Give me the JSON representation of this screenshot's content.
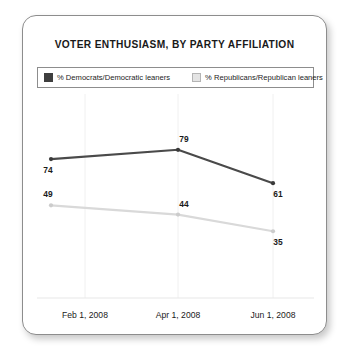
{
  "card": {
    "title": "VOTER ENTHUSIASM, BY PARTY AFFILIATION",
    "border_color": "#8d8d8d",
    "background": "#ffffff"
  },
  "legend": {
    "entries": [
      {
        "label": "% Democrats/Democratic leaners",
        "color": "#3f3f3f",
        "swatch": "dem"
      },
      {
        "label": "% Republicans/Republican leaners",
        "color": "#e4e4e4",
        "swatch": "rep"
      }
    ]
  },
  "chart_data": {
    "type": "line",
    "title": "VOTER ENTHUSIASM, BY PARTY AFFILIATION",
    "xlabel": "",
    "ylabel": "",
    "categories": [
      "Feb 1, 2008",
      "Apr 1, 2008",
      "Jun 1, 2008"
    ],
    "x_tick_labels": [
      "Feb 1, 2008",
      "Apr 1, 2008",
      "Jun 1, 2008"
    ],
    "ylim": [
      0,
      100
    ],
    "grid": "vertical-only",
    "legend_position": "top",
    "series": [
      {
        "name": "% Democrats/Democratic leaners",
        "color": "#4a4a4a",
        "values": [
          74,
          79,
          61
        ],
        "point_labels": [
          "74",
          "79",
          "61"
        ]
      },
      {
        "name": "% Republicans/Republican leaners",
        "color": "#d9d9d9",
        "values": [
          49,
          44,
          35
        ],
        "point_labels": [
          "49",
          "44",
          "35"
        ]
      }
    ]
  }
}
